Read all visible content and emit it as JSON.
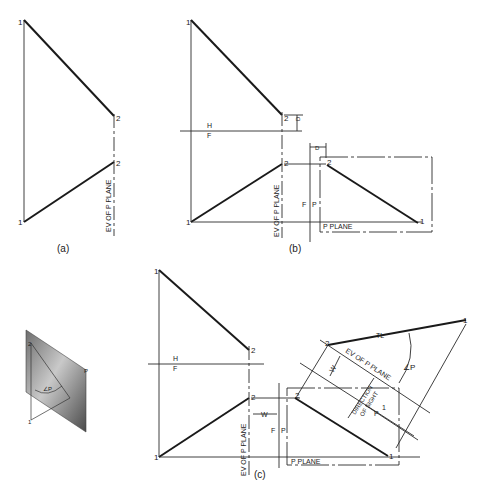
{
  "figure": {
    "panel_a": {
      "caption": "(a)",
      "point1_top": "1",
      "point1_bottom": "1",
      "point2_top": "2",
      "point2_bottom": "2",
      "ev_label": "EV OF P PLANE"
    },
    "panel_b": {
      "caption": "(b)",
      "point1_top": "1",
      "point1_bottom": "1",
      "point2_top": "2",
      "point2_bottom": "2",
      "fold_h": "H",
      "fold_f": "F",
      "dim_d_top": "D",
      "dim_d_aux": "D",
      "ev_label": "EV OF P PLANE",
      "fold2_f": "F",
      "fold2_p": "P",
      "aux_point2": "2",
      "aux_point1": "1",
      "p_plane_label": "P PLANE"
    },
    "panel_c": {
      "caption": "(c)",
      "point1_top": "1",
      "point1_bottom": "1",
      "point2_top": "2",
      "point2_bottom": "2",
      "fold_h": "H",
      "fold_f": "F",
      "ev_label": "EV OF P PLANE",
      "dim_w": "W",
      "fold2_f": "F",
      "fold2_p": "P",
      "aux_point2": "2",
      "aux_point1": "1",
      "p_plane_label": "P PLANE",
      "tl_label": "TL",
      "tl_point2": "2",
      "tl_point1": "1",
      "angle_label": "∠P",
      "ev_aux_label": "EV OF P PLANE",
      "dim_w_aux": "W",
      "direction_label_1": "DIRECTION",
      "direction_label_2": "OF SIGHT",
      "fold3_p": "P",
      "fold3_1": "1"
    },
    "pictorial": {
      "point1": "1",
      "point2": "2",
      "plane_label": "P",
      "angle_label": "∠P"
    }
  }
}
